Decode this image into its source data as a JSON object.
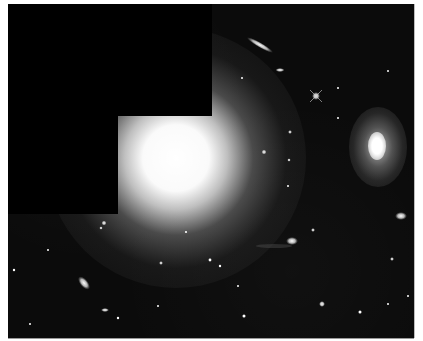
{
  "image": {
    "subject": "deep-field astronomical photograph of a galaxy cluster",
    "background_color": "#0b0b0b",
    "mask_color": "#000000",
    "frame": {
      "x": 8,
      "y": 4,
      "width": 406,
      "height": 334
    },
    "masked_regions": [
      {
        "name": "top-left-mask",
        "x": 0,
        "y": 0,
        "width": 204,
        "height": 112
      },
      {
        "name": "left-mask",
        "x": 0,
        "y": 112,
        "width": 110,
        "height": 98
      }
    ],
    "objects": [
      {
        "name": "giant-elliptical-galaxy",
        "cx": 176,
        "cy": 162,
        "rx": 42,
        "ry": 42,
        "halo": 110
      },
      {
        "name": "spiral-galaxy-right",
        "cx": 377,
        "cy": 147,
        "rx": 10,
        "ry": 15,
        "halo": 38
      },
      {
        "name": "edge-on-galaxy-top",
        "cx": 260,
        "cy": 45,
        "rx": 14,
        "ry": 2.5,
        "angle": 30
      },
      {
        "name": "small-galaxy-top",
        "cx": 280,
        "cy": 70,
        "rx": 4,
        "ry": 2
      },
      {
        "name": "bright-star",
        "cx": 316,
        "cy": 96,
        "r": 3
      },
      {
        "name": "galaxy-lower-left",
        "cx": 84,
        "cy": 283,
        "rx": 4,
        "ry": 7,
        "angle": -35
      },
      {
        "name": "interacting-galaxy-center",
        "cx": 292,
        "cy": 241,
        "rx": 6,
        "ry": 4
      },
      {
        "name": "merger-right",
        "cx": 401,
        "cy": 216,
        "rx": 6,
        "ry": 4
      },
      {
        "name": "star-bottom-center",
        "cx": 322,
        "cy": 304,
        "r": 2.5
      }
    ]
  }
}
